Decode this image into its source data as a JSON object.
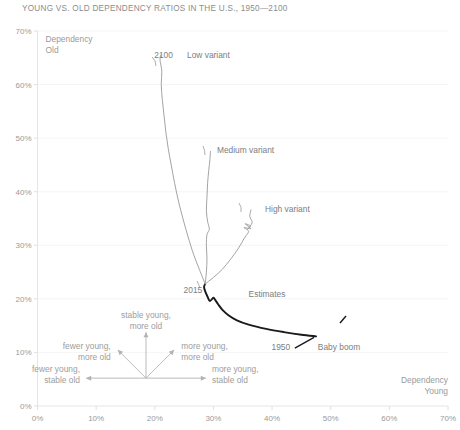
{
  "chart_data": {
    "type": "line",
    "title": "YOUNG VS. OLD DEPENDENCY RATIOS IN THE U.S., 1950—2100",
    "xlabel": "Dependency Young",
    "ylabel": "Dependency Old",
    "xlim": [
      0,
      70
    ],
    "ylim": [
      0,
      70
    ],
    "grid": true,
    "legend_position": "inline-annotations",
    "xticks": [
      "0%",
      "10%",
      "20%",
      "30%",
      "40%",
      "50%",
      "60%",
      "70%"
    ],
    "yticks": [
      "0%",
      "10%",
      "20%",
      "30%",
      "40%",
      "50%",
      "60%",
      "70%"
    ],
    "xtick_values": [
      0,
      10,
      20,
      30,
      40,
      50,
      60,
      70
    ],
    "ytick_values": [
      0,
      10,
      20,
      30,
      40,
      50,
      60,
      70
    ],
    "series": [
      {
        "name": "Estimates",
        "color": "#1a1a1a",
        "note": "Historical path 1950 to 2015, sweeping from the baby boom peak leftward to 2015",
        "points": [
          [
            47.5,
            13.0
          ],
          [
            45.0,
            13.3
          ],
          [
            42.0,
            13.8
          ],
          [
            39.0,
            14.4
          ],
          [
            36.0,
            15.2
          ],
          [
            34.0,
            16.0
          ],
          [
            32.5,
            17.0
          ],
          [
            31.5,
            18.0
          ],
          [
            30.8,
            19.0
          ],
          [
            30.3,
            19.8
          ],
          [
            30.0,
            20.2
          ],
          [
            29.4,
            19.6
          ],
          [
            29.0,
            20.4
          ],
          [
            28.6,
            21.4
          ],
          [
            28.4,
            22.2
          ],
          [
            28.6,
            22.8
          ]
        ]
      },
      {
        "name": "Low variant",
        "color": "#9e9e9e",
        "points": [
          [
            28.6,
            22.8
          ],
          [
            27.6,
            25.5
          ],
          [
            26.4,
            29.0
          ],
          [
            25.3,
            33.0
          ],
          [
            24.2,
            37.5
          ],
          [
            23.4,
            41.5
          ],
          [
            22.8,
            45.0
          ],
          [
            22.3,
            48.0
          ],
          [
            21.9,
            51.0
          ],
          [
            21.6,
            54.0
          ],
          [
            21.3,
            57.0
          ],
          [
            21.1,
            60.0
          ],
          [
            21.2,
            62.5
          ],
          [
            20.9,
            64.5
          ],
          [
            21.0,
            65.5
          ]
        ]
      },
      {
        "name": "Medium variant",
        "color": "#9e9e9e",
        "points": [
          [
            28.6,
            22.8
          ],
          [
            28.8,
            25.0
          ],
          [
            28.9,
            27.5
          ],
          [
            28.8,
            30.0
          ],
          [
            28.9,
            32.0
          ],
          [
            29.3,
            33.0
          ],
          [
            29.0,
            34.5
          ],
          [
            28.8,
            36.5
          ],
          [
            28.9,
            39.0
          ],
          [
            29.0,
            41.5
          ],
          [
            29.2,
            44.0
          ],
          [
            29.4,
            46.0
          ],
          [
            29.5,
            47.5
          ]
        ]
      },
      {
        "name": "High variant",
        "color": "#9e9e9e",
        "points": [
          [
            28.6,
            22.8
          ],
          [
            30.0,
            24.0
          ],
          [
            31.5,
            25.5
          ],
          [
            33.0,
            27.5
          ],
          [
            34.3,
            29.5
          ],
          [
            35.3,
            31.4
          ],
          [
            36.0,
            32.6
          ],
          [
            35.2,
            33.3
          ],
          [
            36.4,
            33.1
          ],
          [
            35.4,
            34.0
          ],
          [
            36.3,
            33.6
          ],
          [
            35.8,
            33.0
          ],
          [
            36.6,
            34.2
          ],
          [
            36.2,
            35.4
          ],
          [
            36.4,
            36.6
          ]
        ]
      }
    ],
    "point_labels": [
      {
        "text": "1950",
        "x": 41.5,
        "y": 11.0,
        "anchor_x": 47.5,
        "anchor_y": 13.0
      },
      {
        "text": "2015",
        "x": 26.5,
        "y": 21.6,
        "anchor_x": 28.6,
        "anchor_y": 22.8
      },
      {
        "text": "2100",
        "x": 21.5,
        "y": 65.5,
        "anchor_x": 21.0,
        "anchor_y": 65.5
      }
    ],
    "annotations": [
      {
        "text": "Low variant",
        "x": 25.5,
        "y": 65.5
      },
      {
        "text": "Medium variant",
        "x": 30.6,
        "y": 47.8
      },
      {
        "text": "High variant",
        "x": 38.8,
        "y": 36.8
      },
      {
        "text": "Estimates",
        "x": 36.0,
        "y": 21.0
      },
      {
        "text": "Baby boom",
        "x": 47.8,
        "y": 11.0
      }
    ],
    "compass": {
      "origin_x": 18.5,
      "origin_y": 5.2,
      "directions": [
        {
          "label_line1": "stable young,",
          "label_line2": "more old",
          "direction": "up"
        },
        {
          "label_line1": "fewer young,",
          "label_line2": "more old",
          "direction": "up-left"
        },
        {
          "label_line1": "more young,",
          "label_line2": "more old",
          "direction": "up-right"
        },
        {
          "label_line1": "fewer young,",
          "label_line2": "stable old",
          "direction": "left"
        },
        {
          "label_line1": "more young,",
          "label_line2": "stable old",
          "direction": "right"
        }
      ]
    },
    "colors": {
      "projection": "#9e9e9e",
      "estimates": "#1a1a1a",
      "grid": "#f2f2f2",
      "axis": "#e2e2e2",
      "text": "#8a8a8a"
    }
  }
}
